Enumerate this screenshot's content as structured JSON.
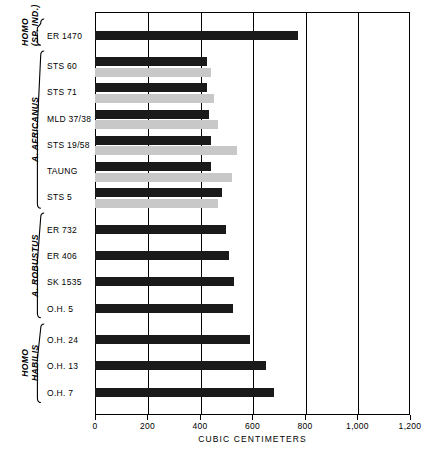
{
  "chart_data": {
    "type": "bar",
    "orientation": "horizontal",
    "title": "",
    "xlabel": "CUBIC CENTIMETERS",
    "ylabel": "",
    "xlim": [
      0,
      1200
    ],
    "xticks": [
      0,
      200,
      400,
      600,
      800,
      1000,
      1200
    ],
    "xticklabels": [
      "0",
      "200",
      "400",
      "600",
      "800",
      "1,000",
      "1,200"
    ],
    "grid": "vertical gridlines at each 200 cc tick",
    "legend": "none (dark bar = first estimate, light bar = second estimate)",
    "series": [
      {
        "name": "estimate-dark",
        "color": "#1a1a1a"
      },
      {
        "name": "estimate-light",
        "color": "#c8c8c8"
      }
    ],
    "groups": [
      {
        "name": "HOMO (SP. IND.)",
        "name_lines": [
          "HOMO",
          "(SP. IND.)"
        ],
        "italic": true,
        "specimens": [
          {
            "label": "ER 1470",
            "dark": 775,
            "light": null
          }
        ]
      },
      {
        "name": "A. AFRICANUS",
        "name_lines": [
          "A. AFRICANUS"
        ],
        "italic": true,
        "specimens": [
          {
            "label": "STS 60",
            "dark": 428,
            "light": 440
          },
          {
            "label": "STS 71",
            "dark": 425,
            "light": 455
          },
          {
            "label": "MLD 37/38",
            "dark": 435,
            "light": 470
          },
          {
            "label": "STS 19/58",
            "dark": 440,
            "light": 540
          },
          {
            "label": "TAUNG",
            "dark": 440,
            "light": 520
          },
          {
            "label": "STS 5",
            "dark": 485,
            "light": 470
          }
        ]
      },
      {
        "name": "A. ROBUSTUS",
        "name_lines": [
          "A. ROBUSTUS"
        ],
        "italic": true,
        "specimens": [
          {
            "label": "ER 732",
            "dark": 500,
            "light": null
          },
          {
            "label": "ER 406",
            "dark": 510,
            "light": null
          },
          {
            "label": "SK 1535",
            "dark": 530,
            "light": null
          },
          {
            "label": "O.H. 5",
            "dark": 525,
            "light": null
          }
        ]
      },
      {
        "name": "HOMO HABILIS",
        "name_lines": [
          "HOMO",
          "HABILIS"
        ],
        "italic": true,
        "specimens": [
          {
            "label": "O.H. 24",
            "dark": 590,
            "light": null
          },
          {
            "label": "O.H. 13",
            "dark": 650,
            "light": null
          },
          {
            "label": "O.H. 7",
            "dark": 680,
            "light": null
          }
        ]
      }
    ]
  },
  "colors": {
    "bar_dark": "#1a1a1a",
    "bar_light": "#c8c8c8",
    "frame": "#000000",
    "background": "#ffffff"
  }
}
